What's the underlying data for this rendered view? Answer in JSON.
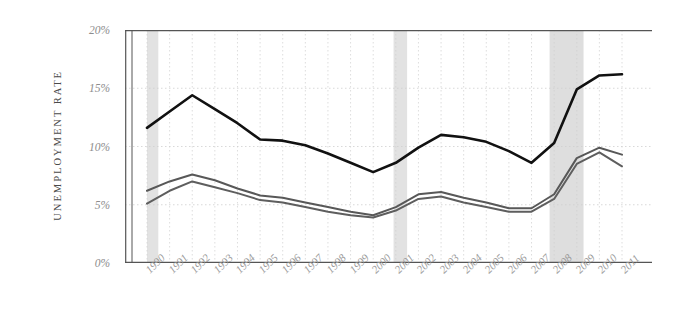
{
  "chart_data": {
    "type": "line",
    "title": "",
    "xlabel": "",
    "ylabel": "UNEMPLOYMENT RATE",
    "ylim": [
      0,
      20
    ],
    "yticks": [
      0,
      5,
      10,
      15,
      20
    ],
    "ytick_labels": [
      "0%",
      "5%",
      "10%",
      "15%",
      "20%"
    ],
    "grid": true,
    "legend": "none",
    "x": [
      1990,
      1991,
      1992,
      1993,
      1994,
      1995,
      1996,
      1997,
      1998,
      1999,
      2000,
      2001,
      2002,
      2003,
      2004,
      2005,
      2006,
      2007,
      2008,
      2009,
      2010,
      2011
    ],
    "categories": [
      "1990",
      "1991",
      "1992",
      "1993",
      "1994",
      "1995",
      "1996",
      "1997",
      "1998",
      "1999",
      "2000",
      "2001",
      "2002",
      "2003",
      "2004",
      "2005",
      "2006",
      "2007",
      "2008",
      "2009",
      "2010",
      "2011"
    ],
    "series": [
      {
        "name": "series-top",
        "color": "#111111",
        "width": 2.6,
        "values": [
          11.6,
          13.0,
          14.4,
          13.2,
          12.0,
          10.6,
          10.5,
          10.1,
          9.4,
          8.6,
          7.8,
          8.6,
          9.9,
          11.0,
          10.8,
          10.4,
          9.6,
          8.6,
          10.3,
          14.9,
          16.1,
          16.2
        ]
      },
      {
        "name": "series-middle",
        "color": "#585858",
        "width": 2.0,
        "values": [
          6.2,
          7.0,
          7.6,
          7.1,
          6.4,
          5.8,
          5.6,
          5.2,
          4.8,
          4.4,
          4.1,
          4.8,
          5.9,
          6.1,
          5.6,
          5.2,
          4.7,
          4.7,
          5.9,
          9.0,
          9.9,
          9.3
        ]
      },
      {
        "name": "series-bottom",
        "color": "#5e5e5e",
        "width": 2.0,
        "values": [
          5.1,
          6.2,
          7.0,
          6.5,
          6.0,
          5.4,
          5.2,
          4.8,
          4.4,
          4.1,
          3.9,
          4.5,
          5.5,
          5.7,
          5.2,
          4.8,
          4.4,
          4.4,
          5.5,
          8.5,
          9.5,
          8.3
        ]
      }
    ],
    "shaded_bands": [
      {
        "name": "recession-1990",
        "start": 1990.0,
        "end": 1990.5,
        "color": "#e2e2e2"
      },
      {
        "name": "recession-2001",
        "start": 2000.9,
        "end": 2001.5,
        "color": "#e2e2e2"
      },
      {
        "name": "recession-2008",
        "start": 2007.8,
        "end": 2009.3,
        "color": "#dedede"
      }
    ],
    "colors": {
      "grid": "#cfcfcf",
      "axis": "#555555",
      "tick_text": "#8d8d8d",
      "axis_title": "#4a4a4a",
      "background": "#ffffff"
    }
  }
}
